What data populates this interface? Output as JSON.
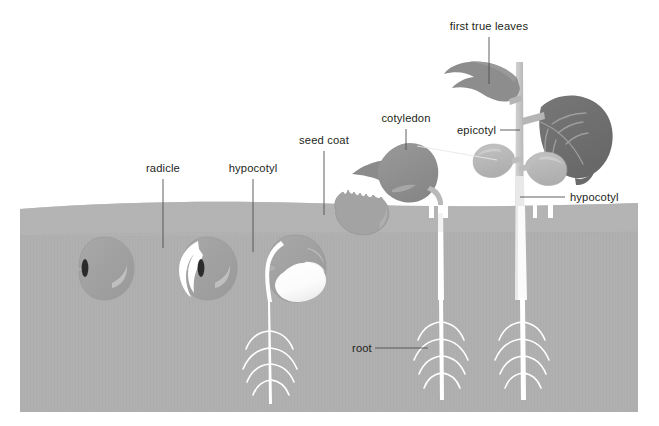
{
  "figure": {
    "width": 659,
    "height": 426
  },
  "palette": {
    "background": "#ffffff",
    "soil": "#b0b0b0",
    "soil_upper_band": "#b7b7b7",
    "soil_edge": "#a8a8a8",
    "seed_coat": "#a2a2a2",
    "seed_coat_dark": "#9a9a9a",
    "seed_highlight": "#c2c2c2",
    "hilum": "#2b2b2b",
    "radicle_white": "#ffffff",
    "cotyledon_white": "#fbfbfb",
    "cotyledon_mid": "#8e8e8e",
    "cotyledon_light": "#b9b9b9",
    "leaf_dark": "#6f6f6f",
    "leaf_mid": "#8a8a8a",
    "stem_light": "#c6c6c6",
    "root_white": "#ffffff",
    "label_text": "#231f20",
    "leader_dark": "#4f4f4f",
    "leader_light": "#e8e8e8"
  },
  "labels": [
    {
      "id": "radicle",
      "text": "radicle",
      "x": 163,
      "y": 172,
      "anchor": "middle"
    },
    {
      "id": "hypocotyl-left",
      "text": "hypocotyl",
      "x": 253,
      "y": 172,
      "anchor": "middle"
    },
    {
      "id": "seed-coat",
      "text": "seed coat",
      "x": 324,
      "y": 144,
      "anchor": "middle"
    },
    {
      "id": "cotyledon",
      "text": "cotyledon",
      "x": 406,
      "y": 122,
      "anchor": "middle"
    },
    {
      "id": "epicotyl",
      "text": "epicotyl",
      "x": 460,
      "y": 133,
      "anchor": "start"
    },
    {
      "id": "first-true-leaves",
      "text": "first true leaves",
      "x": 489,
      "y": 30,
      "anchor": "middle"
    },
    {
      "id": "hypocotyl-right",
      "text": "hypocotyl",
      "x": 568,
      "y": 200,
      "anchor": "start"
    },
    {
      "id": "root",
      "text": "root",
      "x": 353,
      "y": 351,
      "anchor": "start"
    }
  ],
  "stages": [
    {
      "id": "stage-1-dormant-seed",
      "label": "dormant seed",
      "center_x": 101,
      "soil_depth": "buried"
    },
    {
      "id": "stage-2-radicle-emerges",
      "label": "radicle emerges",
      "center_x": 204,
      "soil_depth": "buried"
    },
    {
      "id": "stage-3-hypocotyl-elongates",
      "label": "hypocotyl elongates",
      "center_x": 290,
      "soil_depth": "buried"
    },
    {
      "id": "stage-4-seedling-emerges",
      "label": "seedling emerges",
      "center_x": 404,
      "soil_depth": "emerged"
    },
    {
      "id": "stage-5-true-leaves",
      "label": "first true leaves expand",
      "center_x": 521,
      "soil_depth": "emerged"
    }
  ],
  "soil": {
    "top_y": 203,
    "bottom_y": 412,
    "left_x": 20,
    "right_x": 638,
    "band_y": 234
  }
}
